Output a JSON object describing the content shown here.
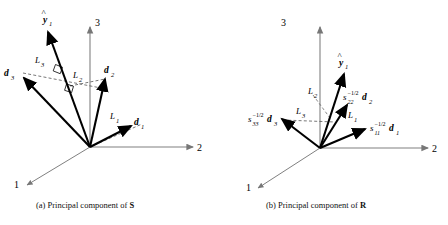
{
  "figure": {
    "background_color": "#ffffff",
    "axis_color": "#777777",
    "vector_color": "#000000",
    "dash_color": "#555555",
    "panels": [
      {
        "id": "panel-a",
        "caption": "(a) Principal component of S",
        "caption_prefix": "(a) Principal component of ",
        "caption_matrix": "S",
        "axes": [
          {
            "name": "axis-1",
            "label": "1"
          },
          {
            "name": "axis-2",
            "label": "2"
          },
          {
            "name": "axis-3",
            "label": "3"
          }
        ],
        "vectors": [
          {
            "name": "vector-d1",
            "label": "d",
            "sub": "1"
          },
          {
            "name": "vector-d2",
            "label": "d",
            "sub": "2"
          },
          {
            "name": "vector-d3",
            "label": "d",
            "sub": "3"
          },
          {
            "name": "vector-yhat1",
            "label": "y",
            "sub": "1",
            "hat": true
          }
        ],
        "projections": [
          {
            "name": "projection-L1",
            "label": "L",
            "sub": "1"
          },
          {
            "name": "projection-L2",
            "label": "L",
            "sub": "2"
          },
          {
            "name": "projection-L3",
            "label": "L",
            "sub": "3"
          }
        ],
        "right_angle_markers": 2
      },
      {
        "id": "panel-b",
        "caption": "(b) Principal component of R",
        "caption_prefix": "(b) Principal component of ",
        "caption_matrix": "R",
        "axes": [
          {
            "name": "axis-1",
            "label": "1"
          },
          {
            "name": "axis-2",
            "label": "2"
          },
          {
            "name": "axis-3",
            "label": "3"
          }
        ],
        "vectors": [
          {
            "name": "vector-s11-d1",
            "scalar": "s",
            "scalar_sub": "11",
            "scalar_sup": "−1/2",
            "label": "d",
            "sub": "1"
          },
          {
            "name": "vector-s22-d2",
            "scalar": "s",
            "scalar_sub": "22",
            "scalar_sup": "−1/2",
            "label": "d",
            "sub": "2"
          },
          {
            "name": "vector-s33-d3",
            "scalar": "s",
            "scalar_sub": "33",
            "scalar_sup": "−1/2",
            "label": "d",
            "sub": "3"
          },
          {
            "name": "vector-yhat1",
            "label": "y",
            "sub": "1",
            "hat": true
          }
        ],
        "projections": [
          {
            "name": "projection-L1",
            "label": "L",
            "sub": "1"
          },
          {
            "name": "projection-L2",
            "label": "L",
            "sub": "2"
          },
          {
            "name": "projection-L3",
            "label": "L",
            "sub": "3"
          }
        ],
        "right_angle_markers": 0
      }
    ]
  }
}
